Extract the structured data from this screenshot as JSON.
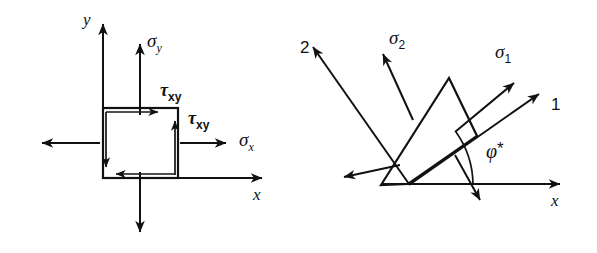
{
  "figure": {
    "background_color": "#ffffff",
    "ink_color": "#111111",
    "width": 597,
    "height": 253
  },
  "left_diagram": {
    "name": "stress-element-xy",
    "description": "Square stress element aligned with x-y axes showing normal stresses sigma-x, sigma-y and shear stresses tau-xy",
    "axes": {
      "x_label": "x",
      "y_label": "y",
      "origin": [
        103,
        178
      ],
      "x_axis_end": [
        268,
        178
      ],
      "y_axis_end": [
        103,
        18
      ]
    },
    "element": {
      "left": 103,
      "top": 108,
      "right": 178,
      "bottom": 178
    },
    "labels": {
      "sigma_y": {
        "base": "σ",
        "sub": "y",
        "x": 147,
        "y": 47
      },
      "tau_xy_top": {
        "base": "τ",
        "sub": "xy",
        "x": 160,
        "y": 96
      },
      "tau_xy_right": {
        "base": "τ",
        "sub": "xy",
        "x": 188,
        "y": 124
      },
      "sigma_x": {
        "base": "σ",
        "sub": "x",
        "x": 239,
        "y": 146
      },
      "x_axis": "x",
      "y_axis": "y"
    },
    "arrows": {
      "sigma_y_up": {
        "from": [
          140,
          115
        ],
        "to": [
          140,
          38
        ]
      },
      "sigma_y_down": {
        "from": [
          140,
          172
        ],
        "to": [
          140,
          238
        ]
      },
      "sigma_x_right": {
        "from": [
          180,
          143
        ],
        "to": [
          232,
          143
        ]
      },
      "sigma_x_left": {
        "from": [
          100,
          143
        ],
        "to": [
          36,
          143
        ]
      },
      "tau_top": {
        "from": [
          106,
          112
        ],
        "to": [
          163,
          112
        ]
      },
      "tau_bottom": {
        "from": [
          175,
          174
        ],
        "to": [
          110,
          174
        ]
      },
      "tau_right": {
        "from": [
          175,
          175
        ],
        "to": [
          175,
          116
        ]
      },
      "tau_left": {
        "from": [
          106,
          112
        ],
        "to": [
          106,
          172
        ]
      }
    }
  },
  "right_diagram": {
    "name": "principal-stress-element",
    "description": "Rotated square element aligned with principal axes 1 and 2, showing principal stresses sigma-1 and sigma-2 and the principal angle phi-star measured from the x axis",
    "rotation_angle_deg": 35,
    "axes": {
      "x_label": "x",
      "axis_1_label": "1",
      "axis_2_label": "2",
      "origin": [
        381,
        184
      ],
      "x_axis_end": [
        566,
        184
      ]
    },
    "element": {
      "corners": [
        [
          381,
          185
        ],
        [
          449,
          78
        ],
        [
          477,
          136
        ],
        [
          408,
          184
        ]
      ],
      "center": [
        429,
        134
      ]
    },
    "labels": {
      "sigma_1": {
        "base": "σ",
        "sub": "1",
        "x": 495,
        "y": 58
      },
      "sigma_2": {
        "base": "σ",
        "sub": "2",
        "x": 389,
        "y": 44
      },
      "axis_1": {
        "text": "1",
        "x": 551,
        "y": 110
      },
      "axis_2": {
        "text": "2",
        "x": 300,
        "y": 53
      },
      "phi_star": {
        "base": "φ",
        "star": "*",
        "x": 486,
        "y": 158
      },
      "x_axis": {
        "text": "x",
        "x": 551,
        "y": 200
      }
    },
    "arrows": {
      "axis_1_direction": {
        "from": [
          410,
          185
        ],
        "to": [
          545,
          90
        ]
      },
      "axis_2_direction": {
        "from": [
          409,
          184
        ],
        "to": [
          309,
          41
        ]
      },
      "sigma_1_out": {
        "from": [
          455,
          132
        ],
        "to": [
          520,
          78
        ]
      },
      "sigma_1_in": {
        "from": [
          400,
          165
        ],
        "to": [
          338,
          178
        ]
      },
      "sigma_2_out": {
        "from": [
          413,
          120
        ],
        "to": [
          381,
          48
        ]
      },
      "sigma_2_in": {
        "from": [
          455,
          155
        ],
        "to": [
          482,
          206
        ]
      },
      "angle_arc": {
        "vertex": [
          381,
          184
        ],
        "radius": 92,
        "start_deg": 0,
        "end_deg": 35
      }
    }
  }
}
